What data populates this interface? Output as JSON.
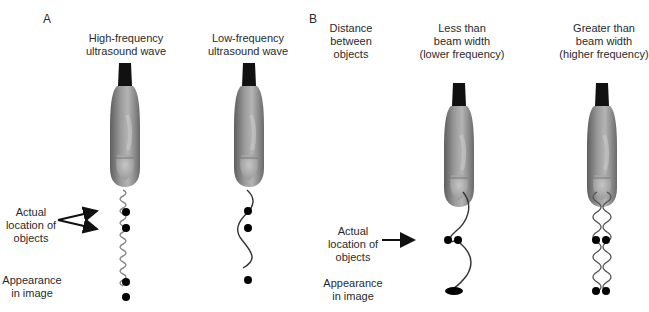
{
  "panels": {
    "a": {
      "letter": "A",
      "probes": [
        {
          "title_line1": "High-frequency",
          "title_line2": "ultrasound wave"
        },
        {
          "title_line1": "Low-frequency",
          "title_line2": "ultrasound wave"
        }
      ],
      "actual_location_label": {
        "line1": "Actual",
        "line2": "location of",
        "line3": "objects"
      },
      "appearance_label": {
        "line1": "Appearance",
        "line2": "in image"
      }
    },
    "b": {
      "letter": "B",
      "distance_label": {
        "line1": "Distance",
        "line2": "between",
        "line3": "objects"
      },
      "probes": [
        {
          "title_line1": "Less than",
          "title_line2": "beam width",
          "title_line3": "(lower frequency)"
        },
        {
          "title_line1": "Greater than",
          "title_line2": "beam width",
          "title_line3": "(higher frequency)"
        }
      ],
      "actual_location_label": {
        "line1": "Actual",
        "line2": "location of",
        "line3": "objects"
      },
      "appearance_label": {
        "line1": "Appearance",
        "line2": "in image"
      }
    }
  },
  "colors": {
    "probe_cap": "#111111",
    "probe_body": "#8a8a8a",
    "high_freq_wave": "#888888",
    "low_freq_wave": "#333333",
    "object_dot": "#000000"
  }
}
